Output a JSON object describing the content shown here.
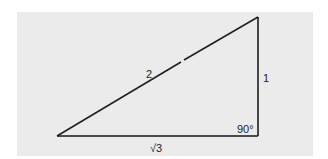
{
  "diagram": {
    "type": "right-triangle",
    "background_color": "#ebebeb",
    "line_color": "#1e1e1e",
    "base_line_color": "#4a4a4a",
    "vertices": {
      "left": [
        57,
        136
      ],
      "right_angle": [
        258,
        136
      ],
      "top": [
        258,
        17
      ]
    },
    "labels": {
      "hypotenuse": "2",
      "vertical_leg": "1",
      "base": "√3",
      "right_angle": "90°"
    }
  }
}
